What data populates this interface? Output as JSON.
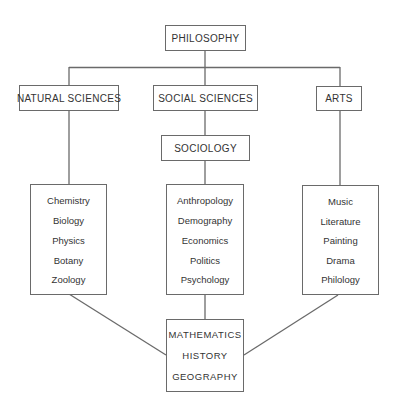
{
  "diagram": {
    "root": {
      "label": "PHILOSOPHY"
    },
    "branches": [
      {
        "label": "NATURAL SCIENCES",
        "subjects": [
          "Chemistry",
          "Biology",
          "Physics",
          "Botany",
          "Zoology"
        ]
      },
      {
        "label": "SOCIAL SCIENCES",
        "sub": {
          "label": "SOCIOLOGY"
        },
        "subjects": [
          "Anthropology",
          "Demography",
          "Economics",
          "Politics",
          "Psychology"
        ]
      },
      {
        "label": "ARTS",
        "subjects": [
          "Music",
          "Literature",
          "Painting",
          "Drama",
          "Philology"
        ]
      }
    ],
    "base": {
      "subjects": [
        "MATHEMATICS",
        "HISTORY",
        "GEOGRAPHY"
      ]
    }
  },
  "colors": {
    "line": "#6a6a6a",
    "text": "#333333",
    "background": "#ffffff"
  }
}
